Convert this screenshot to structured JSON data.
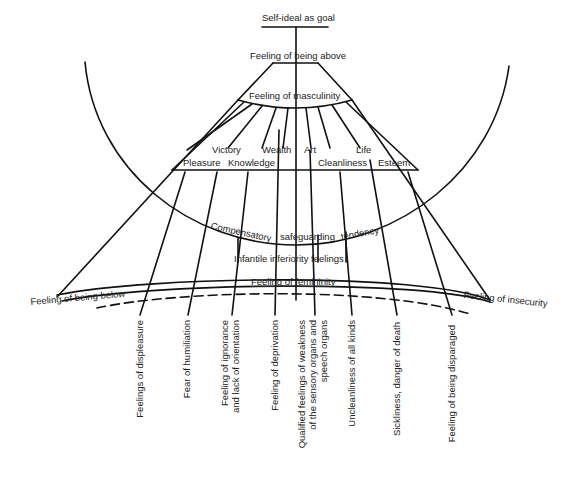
{
  "diagram": {
    "top": {
      "goal": "Self-ideal as goal",
      "above": "Feeling of being above",
      "masculinity": "Feeling of masculinity"
    },
    "values": {
      "upper_row": [
        "Victory",
        "Wealth",
        "Art",
        "Life"
      ],
      "lower_row": [
        "Pleasure",
        "Knowledge",
        "Cleanliness",
        "Esteem"
      ]
    },
    "middle": {
      "compensatory": "Compensatory",
      "safeguarding": "safeguarding",
      "tendency": "tendency",
      "infantile": "Infantile inferiority feelings"
    },
    "bottom": {
      "below": "Feeling of being below",
      "femininity": "Feeling of femininity",
      "insecurity": "Feeling of insecurity"
    },
    "roots": [
      {
        "text": "Feelings of displeasure"
      },
      {
        "text": "Fear of humiliation"
      },
      {
        "text": "Feeling of ignorance\nand lack of orientation"
      },
      {
        "text": "Feeling of deprivation"
      },
      {
        "text": "Qualified feelings of weakness\nof the sensory organs and\nspeech organs"
      },
      {
        "text": "Uncleanliness of all kinds"
      },
      {
        "text": "Sickliness, danger of death"
      },
      {
        "text": "Feeling of being disparaged"
      }
    ],
    "colors": {
      "line": "#111111",
      "background": "#ffffff"
    }
  }
}
